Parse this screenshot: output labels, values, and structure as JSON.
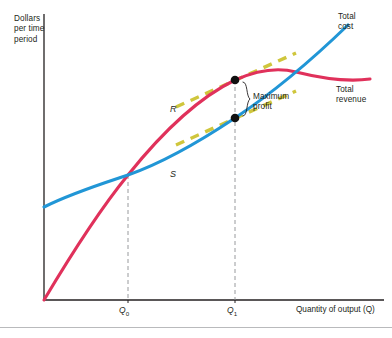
{
  "figure": {
    "type": "line-diagram",
    "axes": {
      "y_label": "Dollars\nper time\nperiod",
      "x_label": "Quantity of output (Q)",
      "origin": {
        "x": 44,
        "y": 300
      },
      "x_ticks": [
        {
          "id": "q0",
          "label": "Q",
          "sub": "0",
          "x": 128
        },
        {
          "id": "q1",
          "label": "Q",
          "sub": "1",
          "x": 235
        }
      ]
    },
    "curves": [
      {
        "name": "total-revenue-curve",
        "symbol": "R",
        "label": "Total\nrevenue",
        "color": "#e0315b",
        "description": "Total revenue curve rising from origin, peaking then declining"
      },
      {
        "name": "total-cost-curve",
        "symbol": "S",
        "label": "Total\ncost",
        "color": "#2196d6",
        "description": "Total cost curve starting above origin at fixed cost, rising with increasing slope"
      }
    ],
    "tangents": {
      "name": "parallel-tangent-lines",
      "color": "#cfc63c",
      "count": 2,
      "description": "Two parallel dashed tangent lines touching revenue and cost curves at Q1"
    },
    "annotation": {
      "label": "Maximum\nprofit",
      "brace": true,
      "at_quantity": "Q1"
    },
    "markers": [
      {
        "name": "revenue-tangency-point",
        "x": 235,
        "y": 80
      },
      {
        "name": "cost-tangency-point",
        "x": 235,
        "y": 118
      }
    ],
    "colors": {
      "revenue": "#e0315b",
      "cost": "#2196d6",
      "tangent": "#cfc63c",
      "axis": "#231f20",
      "guide": "#8d8f92",
      "marker": "#111111",
      "rule": "#b9babc"
    }
  }
}
